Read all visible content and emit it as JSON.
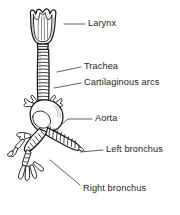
{
  "figure": {
    "background_color": "#ffffff",
    "ink_color": "#1a1a1a",
    "label_color": "#231f20",
    "leader_color": "#3a3a3a"
  },
  "labels": [
    {
      "id": "larynx",
      "text": "Larynx",
      "x": 88,
      "y": 24,
      "leader": "M 64 24 L 85 24"
    },
    {
      "id": "trachea",
      "text": "Trachea",
      "x": 84,
      "y": 67,
      "leader": "M 60 72 L 81 67"
    },
    {
      "id": "cartilaginous-arcs",
      "text": "Cartilaginous arcs",
      "x": 84,
      "y": 83,
      "leader": "M 59 87 L 81 83"
    },
    {
      "id": "aorta",
      "text": "Aorta",
      "x": 95,
      "y": 119,
      "leader": "M 68 121 L 92 119"
    },
    {
      "id": "left-bronchus",
      "text": "Left bronchus",
      "x": 106,
      "y": 150,
      "leader": "M 82 153 L 103 150"
    },
    {
      "id": "right-bronchus",
      "text": "Right bronchus",
      "x": 83,
      "y": 189,
      "leader": "M 50 165 L 80 185"
    }
  ],
  "structures": {
    "larynx": "thyroid cartilage with superior notch",
    "trachea": "tube with stacked cartilage rings",
    "aorta": "arch with branching vessels",
    "left_bronchus": "ringed branch to viewer right",
    "right_bronchus": "ringed branch to viewer left with subdivisions"
  }
}
